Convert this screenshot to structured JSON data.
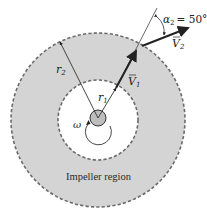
{
  "diagram": {
    "region_label": "Impeller region",
    "labels": {
      "r1": "r",
      "r1_sub": "1",
      "r2": "r",
      "r2_sub": "2",
      "V1": "V",
      "V1_sub": "1",
      "V2": "V",
      "V2_sub": "2",
      "alpha": "α",
      "alpha_sub": "2",
      "alpha_value": "= 50°",
      "omega": "ω"
    },
    "colors": {
      "annulus_fill": "#d4d4d4",
      "dash_stroke": "#6a6a6a",
      "line": "#333333"
    }
  }
}
